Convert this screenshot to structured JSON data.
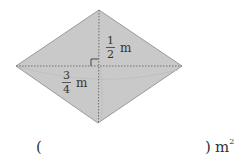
{
  "diagram": {
    "shape": "rhombus",
    "fill_color": "#c9c9c9",
    "edge_color": "#9a9a9a",
    "diagonal_color": "#777777",
    "vertices": {
      "top": [
        99,
        10
      ],
      "left": [
        16,
        66
      ],
      "right": [
        182,
        66
      ],
      "bottom": [
        98,
        123
      ]
    },
    "right_angle_marker": true,
    "labels": {
      "half": {
        "numerator": "1",
        "denominator": "2",
        "unit": "m"
      },
      "three_quarter": {
        "numerator": "3",
        "denominator": "4",
        "unit": "m"
      }
    }
  },
  "answer": {
    "open_paren": "(",
    "value": "",
    "close_paren": ")",
    "unit": "m",
    "unit_exponent": "2"
  }
}
